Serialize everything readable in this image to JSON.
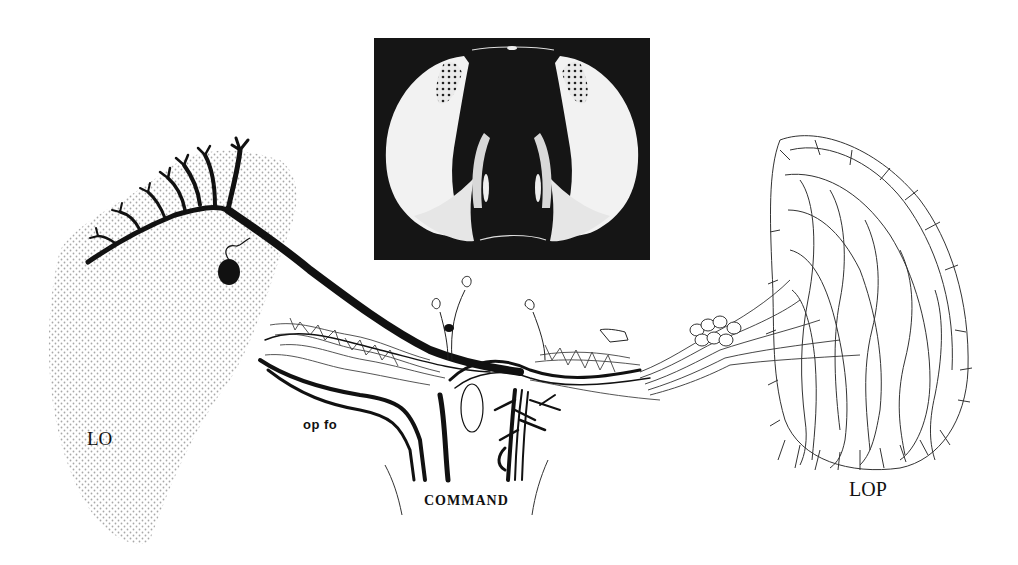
{
  "figure": {
    "labels": {
      "lo": "LO",
      "op_fo": "op fo",
      "command": "COMMAND",
      "lop": "LOP"
    },
    "inset": {
      "description": "fly-head-frontal-photo"
    },
    "colors": {
      "background": "#ffffff",
      "ink": "#111111",
      "stipple": "#9a9a9a",
      "inset_bg": "#151515",
      "eye_fill": "#f2f2f2"
    }
  }
}
